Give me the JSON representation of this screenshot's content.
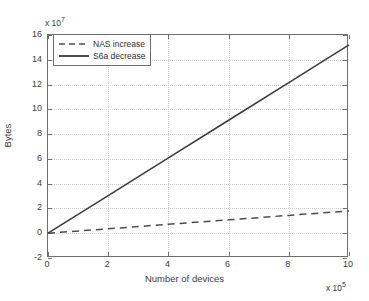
{
  "chart_data": {
    "type": "line",
    "title": "",
    "xlabel": "Number of devices",
    "ylabel": "Bytes",
    "x_multiplier_prefix": "x 10",
    "x_multiplier_exponent": "5",
    "y_multiplier_prefix": "x 10",
    "y_multiplier_exponent": "7",
    "xlim": [
      0,
      10
    ],
    "ylim": [
      -2,
      16
    ],
    "xticks": [
      "0",
      "2",
      "4",
      "6",
      "8",
      "10"
    ],
    "xtick_values": [
      0,
      2,
      4,
      6,
      8,
      10
    ],
    "yticks": [
      "-2",
      "0",
      "2",
      "4",
      "6",
      "8",
      "10",
      "12",
      "14",
      "16"
    ],
    "ytick_values": [
      -2,
      0,
      2,
      4,
      6,
      8,
      10,
      12,
      14,
      16
    ],
    "grid": true,
    "grid_style": "dotted",
    "legend_position": "upper-left",
    "series": [
      {
        "name": "NAS increase",
        "style": "dashed",
        "color": "#4d4d4d",
        "x": [
          0,
          2,
          4,
          6,
          8,
          10
        ],
        "y": [
          0,
          0.36,
          0.72,
          1.08,
          1.44,
          1.8
        ]
      },
      {
        "name": "S6a decrease",
        "style": "solid",
        "color": "#3a3a3a",
        "x": [
          0,
          2,
          4,
          6,
          8,
          10
        ],
        "y": [
          0,
          3.04,
          6.08,
          9.12,
          12.16,
          15.2
        ]
      }
    ]
  },
  "legend": {
    "entries": [
      {
        "label": "NAS increase"
      },
      {
        "label": "S6a decrease"
      }
    ]
  },
  "axes": {
    "x_title": "Number of devices",
    "y_title": "Bytes"
  },
  "colors": {
    "axis": "#6e6e6e",
    "grid": "#cfcfcf",
    "series_dashed": "#4d4d4d",
    "series_solid": "#3a3a3a",
    "background": "#ffffff"
  }
}
